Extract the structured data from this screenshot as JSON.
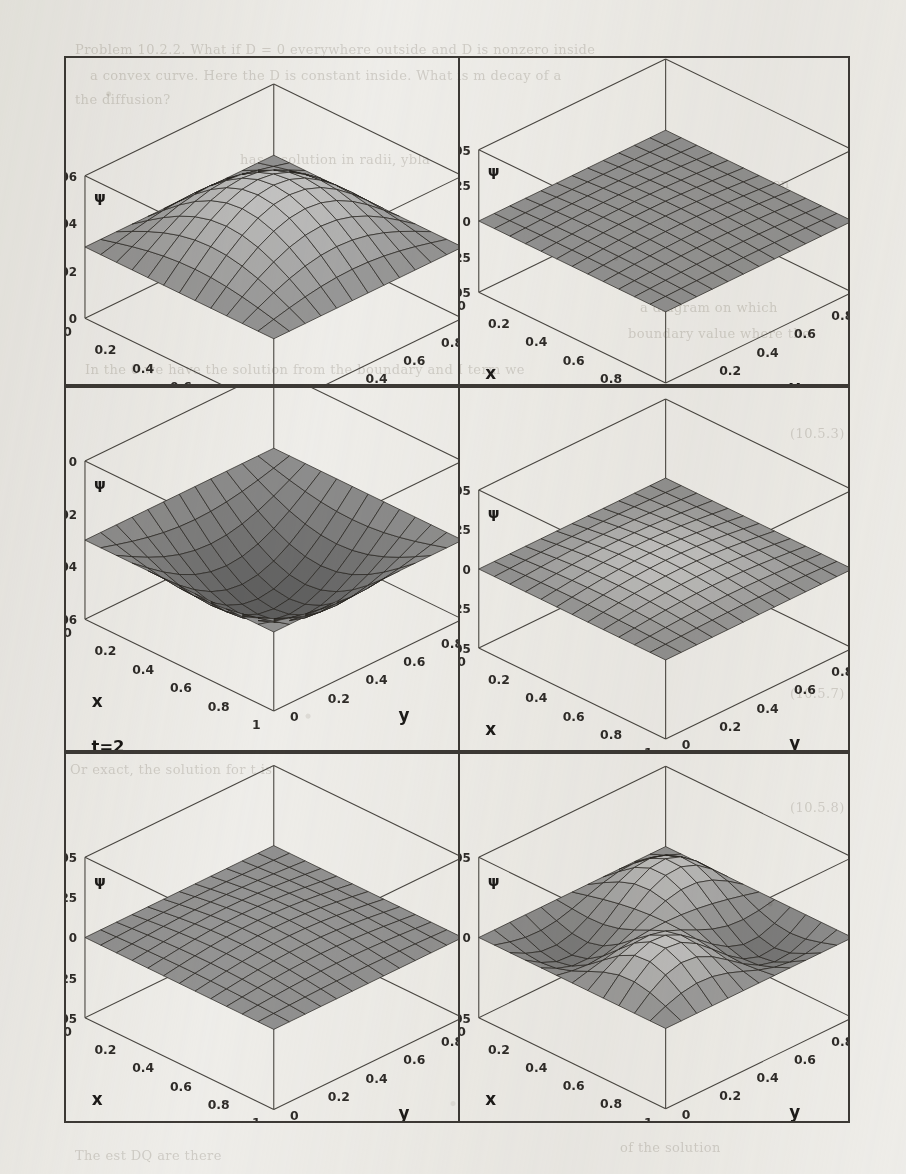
{
  "page": {
    "background_color": "#f1f0ed",
    "ink_color": "#2f2c29",
    "kind": "scanned-book-figure-page"
  },
  "ghost_text": [
    {
      "text": "Problem 10.2.2.  What if D = 0 everywhere outside and D is nonzero inside",
      "x": 75,
      "y": 42
    },
    {
      "text": "a convex curve. Here the D is constant inside. What is m decay of a",
      "x": 90,
      "y": 68
    },
    {
      "text": "the diffusion?",
      "x": 75,
      "y": 92
    },
    {
      "text": "has a solution in radii,   ybla",
      "x": 240,
      "y": 152
    },
    {
      "text": "occurs.  Even",
      "x": 700,
      "y": 176
    },
    {
      "text": "dissipations   with",
      "x": 690,
      "y": 200
    },
    {
      "text": "to the outward flow",
      "x": 678,
      "y": 224
    },
    {
      "text": "a diagram on which",
      "x": 640,
      "y": 300
    },
    {
      "text": "boundary value where the",
      "x": 628,
      "y": 326
    },
    {
      "text": "In the 0 we have the solution from the boundary and I term we",
      "x": 85,
      "y": 362
    },
    {
      "text": "(10.5.3)",
      "x": 790,
      "y": 426
    },
    {
      "text": "(10.5.7)",
      "x": 790,
      "y": 686
    },
    {
      "text": "(10.5.8)",
      "x": 790,
      "y": 800
    },
    {
      "text": "Or exact, the solution for t is",
      "x": 70,
      "y": 762
    },
    {
      "text": "The est DQ are there",
      "x": 75,
      "y": 1148
    },
    {
      "text": "of the solution",
      "x": 620,
      "y": 1140
    }
  ],
  "figure": {
    "caption_missing": true,
    "panel_count": 6,
    "shared": {
      "x_label": "x",
      "y_label": "y",
      "z_label": "ψ",
      "x_ticks": [
        "0",
        "0.2",
        "0.4",
        "0.6",
        "0.8",
        "1"
      ],
      "y_ticks": [
        "1",
        "0.8",
        "0.6",
        "0.4",
        "0.2",
        "0"
      ],
      "mesh_n": 12
    },
    "panels": [
      {
        "id": "t0",
        "time_label": "t=0",
        "z_ticks": [
          "0.06",
          "0.04",
          "0.02",
          "0"
        ],
        "z_min": 0,
        "z_max": 0.06,
        "shape": "dome",
        "amplitude": 0.06,
        "description": "single positive dome peaking near the centre"
      },
      {
        "id": "t1",
        "time_label": "t=1",
        "z_ticks": [
          "0.05",
          "0.025",
          "0",
          "-0.025",
          "-0.05"
        ],
        "z_min": -0.05,
        "z_max": 0.05,
        "shape": "flat",
        "amplitude": 0.002,
        "description": "essentially flat sheet at ψ≈0"
      },
      {
        "id": "t2",
        "time_label": "t=2",
        "z_ticks": [
          "0",
          "-0.02",
          "-0.04",
          "-0.06"
        ],
        "z_min": -0.06,
        "z_max": 0,
        "shape": "bowl",
        "amplitude": -0.06,
        "description": "inverted dome, negative well peaking downward at centre"
      },
      {
        "id": "t3",
        "time_label": "t=3",
        "z_ticks": [
          "0.05",
          "0.025",
          "0",
          "-0.025",
          "-0.05"
        ],
        "z_min": -0.05,
        "z_max": 0.05,
        "shape": "dome",
        "amplitude": 0.012,
        "description": "small positive dome, low amplitude"
      },
      {
        "id": "t4",
        "time_label": "t=4",
        "z_ticks": [
          "0.05",
          "0.025",
          "0",
          "-0.025",
          "-0.05"
        ],
        "z_min": -0.05,
        "z_max": 0.05,
        "shape": "flat",
        "amplitude": 0.004,
        "description": "nearly flat sheet at ψ≈0"
      },
      {
        "id": "t6",
        "time_label": "t=6",
        "z_ticks": [
          "0.005",
          "0",
          "-0.005"
        ],
        "z_min": -0.005,
        "z_max": 0.005,
        "shape": "saddle",
        "amplitude": 0.005,
        "description": "rippled saddle: positive ridge toward back-left, depression toward front-right"
      }
    ]
  },
  "chart_data": {
    "type": "surface",
    "title": "",
    "xlabel": "x",
    "ylabel": "y",
    "zlabel": "ψ",
    "xlim": [
      0,
      1
    ],
    "ylim": [
      0,
      1
    ],
    "grid": true,
    "legend": "none",
    "surfaces": [
      {
        "name": "t=0",
        "zlim": [
          0,
          0.06
        ],
        "z_tick_values": [
          0,
          0.02,
          0.04,
          0.06
        ],
        "x_tick_values": [
          0,
          0.2,
          0.4,
          0.6,
          0.8,
          1
        ],
        "y_tick_values": [
          0,
          0.2,
          0.4,
          0.6,
          0.8,
          1
        ],
        "formula_hint": "A*sin(pi*x)*sin(pi*y)",
        "peak_value": 0.06,
        "peak_at": [
          0.5,
          0.5
        ]
      },
      {
        "name": "t=1",
        "zlim": [
          -0.05,
          0.05
        ],
        "z_tick_values": [
          -0.05,
          -0.025,
          0,
          0.025,
          0.05
        ],
        "x_tick_values": [
          0,
          0.2,
          0.4,
          0.6,
          0.8,
          1
        ],
        "y_tick_values": [
          0,
          0.2,
          0.4,
          0.6,
          0.8,
          1
        ],
        "formula_hint": "A*sin(pi*x)*sin(pi*y), A≈0",
        "peak_value": 0.002,
        "peak_at": [
          0.5,
          0.5
        ]
      },
      {
        "name": "t=2",
        "zlim": [
          -0.06,
          0
        ],
        "z_tick_values": [
          -0.06,
          -0.04,
          -0.02,
          0
        ],
        "x_tick_values": [
          0,
          0.2,
          0.4,
          0.6,
          0.8,
          1
        ],
        "y_tick_values": [
          0,
          0.2,
          0.4,
          0.6,
          0.8,
          1
        ],
        "formula_hint": "-A*sin(pi*x)*sin(pi*y)",
        "peak_value": -0.06,
        "peak_at": [
          0.5,
          0.5
        ]
      },
      {
        "name": "t=3",
        "zlim": [
          -0.05,
          0.05
        ],
        "z_tick_values": [
          -0.05,
          -0.025,
          0,
          0.025,
          0.05
        ],
        "x_tick_values": [
          0,
          0.2,
          0.4,
          0.6,
          0.8,
          1
        ],
        "y_tick_values": [
          0,
          0.2,
          0.4,
          0.6,
          0.8,
          1
        ],
        "formula_hint": "A*sin(pi*x)*sin(pi*y), A small",
        "peak_value": 0.012,
        "peak_at": [
          0.5,
          0.5
        ]
      },
      {
        "name": "t=4",
        "zlim": [
          -0.05,
          0.05
        ],
        "z_tick_values": [
          -0.05,
          -0.025,
          0,
          0.025,
          0.05
        ],
        "x_tick_values": [
          0,
          0.2,
          0.4,
          0.6,
          0.8,
          1
        ],
        "y_tick_values": [
          0,
          0.2,
          0.4,
          0.6,
          0.8,
          1
        ],
        "formula_hint": "A*sin(pi*x)*sin(pi*y), A≈0",
        "peak_value": 0.004,
        "peak_at": [
          0.5,
          0.5
        ]
      },
      {
        "name": "t=6",
        "zlim": [
          -0.005,
          0.005
        ],
        "z_tick_values": [
          -0.005,
          0,
          0.005
        ],
        "x_tick_values": [
          0,
          0.2,
          0.4,
          0.6,
          0.8,
          1
        ],
        "y_tick_values": [
          0,
          0.2,
          0.4,
          0.6,
          0.8,
          1
        ],
        "formula_hint": "mixed modes: sin(pi x)sin(pi y) - sin(2pi x)sin(2pi y)",
        "peak_value": 0.005,
        "peak_at": [
          0.35,
          0.65
        ]
      }
    ]
  }
}
